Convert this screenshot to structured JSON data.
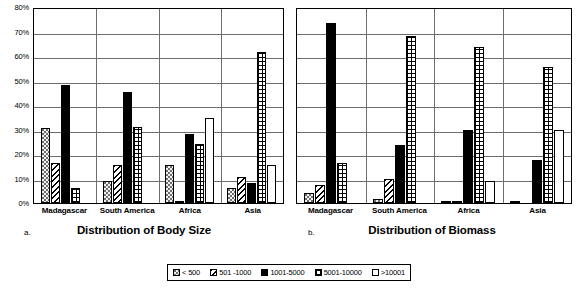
{
  "figure": {
    "panels": [
      {
        "letter": "a.",
        "caption": "Distribution of Body Size",
        "show_y_labels": true
      },
      {
        "letter": "b.",
        "caption": "Distribution of Biomass",
        "show_y_labels": false
      }
    ]
  },
  "legend": {
    "items": [
      {
        "label": "< 500",
        "pattern": "dots"
      },
      {
        "label": "501 -1000",
        "pattern": "hatch"
      },
      {
        "label": "1001-5000",
        "pattern": "solid"
      },
      {
        "label": "5001-10000",
        "pattern": "grid"
      },
      {
        "label": ">10001",
        "pattern": "white"
      }
    ]
  },
  "yticks": [
    "80%",
    "70%",
    "60%",
    "50%",
    "40%",
    "30%",
    "20%",
    "10%",
    "0%"
  ],
  "chart_data": [
    {
      "type": "bar",
      "title": "Distribution of Body Size",
      "panel_letter": "a.",
      "xlabel": "",
      "ylabel": "",
      "ylim": [
        0,
        80
      ],
      "ytick_values": [
        0,
        10,
        20,
        30,
        40,
        50,
        60,
        70,
        80
      ],
      "ytick_labels": [
        "0%",
        "10%",
        "20%",
        "30%",
        "40%",
        "50%",
        "60%",
        "70%",
        "80%"
      ],
      "grid": true,
      "legend_position": "bottom-shared",
      "categories": [
        "Madagascar",
        "South America",
        "Africa",
        "Asia"
      ],
      "series": [
        {
          "name": "< 500",
          "pattern": "dots",
          "values": [
            30.5,
            9.0,
            15.5,
            6.0
          ]
        },
        {
          "name": "501 -1000",
          "pattern": "hatch",
          "values": [
            16.2,
            15.5,
            0.6,
            10.8
          ]
        },
        {
          "name": "1001-5000",
          "pattern": "solid",
          "values": [
            48.0,
            45.2,
            28.2,
            8.0
          ]
        },
        {
          "name": "5001-10000",
          "pattern": "grid",
          "values": [
            6.2,
            31.2,
            24.2,
            61.5
          ]
        },
        {
          "name": ">10001",
          "pattern": "white",
          "values": [
            0,
            0,
            34.5,
            15.4
          ]
        }
      ]
    },
    {
      "type": "bar",
      "title": "Distribution of Biomass",
      "panel_letter": "b.",
      "xlabel": "",
      "ylabel": "",
      "ylim": [
        0,
        80
      ],
      "ytick_values": [
        0,
        10,
        20,
        30,
        40,
        50,
        60,
        70,
        80
      ],
      "ytick_labels": [],
      "grid": true,
      "legend_position": "bottom-shared",
      "categories": [
        "Madagascar",
        "South America",
        "Africa",
        "Asia"
      ],
      "series": [
        {
          "name": "< 500",
          "pattern": "dots",
          "values": [
            4.0,
            1.5,
            1.0,
            1.0
          ]
        },
        {
          "name": "501 -1000",
          "pattern": "hatch",
          "values": [
            7.5,
            10.0,
            0.5,
            0.0
          ]
        },
        {
          "name": "1001-5000",
          "pattern": "solid",
          "values": [
            73.5,
            23.5,
            30.0,
            17.5
          ]
        },
        {
          "name": "5001-10000",
          "pattern": "grid",
          "values": [
            16.5,
            68.0,
            63.5,
            55.5
          ]
        },
        {
          "name": ">10001",
          "pattern": "white",
          "values": [
            0,
            0,
            9.0,
            30.0
          ]
        }
      ]
    }
  ]
}
